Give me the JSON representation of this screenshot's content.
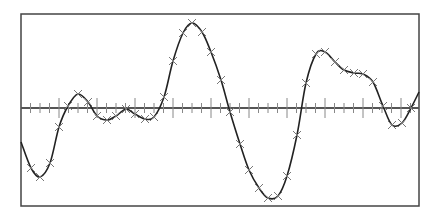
{
  "chart_data": {
    "type": "line",
    "title": "",
    "xlabel": "",
    "ylabel": "",
    "grid": false,
    "legend": null,
    "axis": {
      "horizontal_zero_line": true,
      "minor_tick_spacing_px": 9.5,
      "major_tick_every": 4
    },
    "frame": {
      "x0": 21,
      "y0": 14,
      "x1": 419,
      "y1": 206
    },
    "zero_y_px": 108,
    "colors": {
      "frame": "#444444",
      "axis": "#555555",
      "curve": "#222222",
      "marker": "#777777",
      "background": "#ffffff"
    },
    "series": [
      {
        "name": "signal",
        "marker": "x",
        "points_px": [
          [
            31,
            168
          ],
          [
            40,
            177
          ],
          [
            50,
            163
          ],
          [
            59,
            127
          ],
          [
            68,
            106
          ],
          [
            78,
            94
          ],
          [
            88,
            102
          ],
          [
            97,
            116
          ],
          [
            107,
            120
          ],
          [
            116,
            116
          ],
          [
            126,
            109
          ],
          [
            135,
            114
          ],
          [
            145,
            119
          ],
          [
            154,
            117
          ],
          [
            164,
            97
          ],
          [
            173,
            61
          ],
          [
            183,
            33
          ],
          [
            192,
            23
          ],
          [
            202,
            32
          ],
          [
            211,
            52
          ],
          [
            221,
            80
          ],
          [
            230,
            112
          ],
          [
            240,
            144
          ],
          [
            249,
            170
          ],
          [
            259,
            188
          ],
          [
            268,
            198
          ],
          [
            278,
            196
          ],
          [
            287,
            176
          ],
          [
            297,
            135
          ],
          [
            306,
            83
          ],
          [
            316,
            54
          ],
          [
            325,
            52
          ],
          [
            335,
            62
          ],
          [
            344,
            70
          ],
          [
            354,
            73
          ],
          [
            363,
            74
          ],
          [
            373,
            82
          ],
          [
            383,
            106
          ],
          [
            392,
            125
          ],
          [
            402,
            123
          ],
          [
            411,
            108
          ]
        ],
        "curve_start_px": [
          21,
          142
        ],
        "curve_end_px": [
          419,
          92
        ]
      }
    ]
  }
}
